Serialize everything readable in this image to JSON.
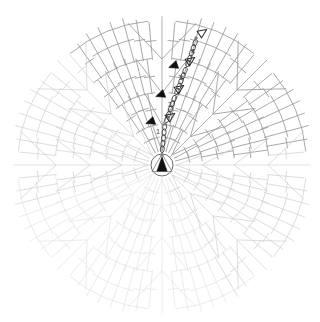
{
  "document": {
    "title": "Crochet Motif Chart",
    "type": "crochet-stitch-diagram",
    "shape": "octagon"
  },
  "canvas": {
    "width": 320,
    "height": 322,
    "background": "#ffffff",
    "center_x": 162,
    "center_y": 165
  },
  "colors": {
    "stitch_line": "#9a9a9a",
    "stitch_line_faint": "#cfcfcf",
    "stitch_line_fainter": "#e2e2e2",
    "marker_fill": "#101010",
    "marker_outline": "#2a2a2a",
    "label_text": "#3a3a3a",
    "ring_stroke": "#6a6a6a",
    "join_dot": "#808080",
    "background": "#ffffff"
  },
  "legend_symbols": [
    {
      "name": "magic-ring",
      "description": "adjustable ring at centre"
    },
    {
      "name": "chain-stitch",
      "description": "chain (ch) shown as small oval"
    },
    {
      "name": "double-crochet",
      "description": "double crochet, vertical bar with one crossbar"
    },
    {
      "name": "round-start-marker",
      "description": "filled black triangle marks start of round"
    },
    {
      "name": "round-end-marker",
      "description": "hollow outlined triangle marks end of round"
    },
    {
      "name": "slip-stitch-dot",
      "description": "small grey dot, slip stitch join"
    }
  ],
  "rounds": [
    {
      "number": "1",
      "label_x": 158,
      "label_y": 134,
      "stitch_count": 16,
      "radius_inner": 14,
      "radius_outer": 40
    },
    {
      "number": "2",
      "label_x": 170,
      "label_y": 107,
      "stitch_count": 32,
      "radius_inner": 40,
      "radius_outer": 72
    },
    {
      "number": "3",
      "label_x": 181,
      "label_y": 80,
      "stitch_count": 48,
      "radius_inner": 72,
      "radius_outer": 106
    },
    {
      "number": "4",
      "label_x": 193,
      "label_y": 54,
      "stitch_count": 64,
      "radius_inner": 106,
      "radius_outer": 143
    }
  ],
  "round_markers": [
    {
      "round": "1",
      "type": "round-start-marker",
      "style": "filled",
      "x": 150,
      "y": 122,
      "rotation": -20
    },
    {
      "round": "1",
      "type": "round-end-marker",
      "style": "hollow",
      "x": 171,
      "y": 116,
      "rotation": -35
    },
    {
      "round": "2",
      "type": "round-start-marker",
      "style": "filled",
      "x": 160,
      "y": 95,
      "rotation": -20
    },
    {
      "round": "2",
      "type": "round-end-marker",
      "style": "hollow",
      "x": 180,
      "y": 88,
      "rotation": -35
    },
    {
      "round": "3",
      "type": "round-start-marker",
      "style": "filled",
      "x": 173,
      "y": 66,
      "rotation": -20
    },
    {
      "round": "3",
      "type": "round-end-marker",
      "style": "hollow",
      "x": 191,
      "y": 60,
      "rotation": -35
    },
    {
      "round": "4",
      "type": "round-end-marker",
      "style": "hollow",
      "x": 203,
      "y": 32,
      "rotation": -35
    }
  ],
  "join_dots": [
    {
      "x": 162,
      "y": 155
    },
    {
      "x": 165,
      "y": 124
    },
    {
      "x": 196,
      "y": 38
    }
  ],
  "chain_runs": [
    {
      "name": "round-1-turning-chain",
      "x1": 162,
      "y1": 152,
      "x2": 165,
      "y2": 124,
      "beads": 5
    },
    {
      "name": "round-2-turning-chain",
      "x1": 166,
      "y1": 122,
      "x2": 175,
      "y2": 96,
      "beads": 5
    },
    {
      "name": "round-3-turning-chain",
      "x1": 176,
      "y1": 94,
      "x2": 186,
      "y2": 68,
      "beads": 5
    },
    {
      "name": "round-4-turning-chain",
      "x1": 187,
      "y1": 66,
      "x2": 196,
      "y2": 40,
      "beads": 5
    }
  ],
  "geometry": {
    "sectors": 8,
    "sector_angle_deg": 45,
    "ring_radius": 11,
    "corner_count": 8,
    "note": "Eight wedge sectors radiating from a central adjustable ring, each sector widening with concentric rounds of double crochet."
  }
}
